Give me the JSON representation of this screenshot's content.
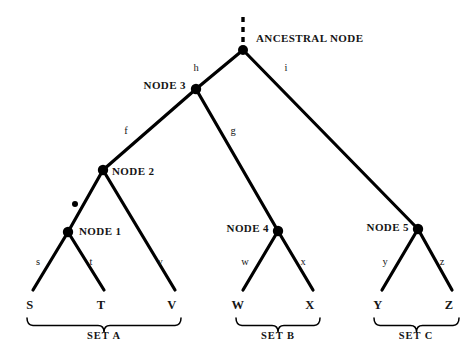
{
  "figure": {
    "type": "phylogenetic-tree-diagram",
    "background_color": "#ffffff",
    "line_color": "#000000",
    "text_color": "#151515"
  },
  "ancestral": {
    "label": "ANCESTRAL NODE",
    "x": 243,
    "y": 50,
    "stem": {
      "x": 243,
      "y_top": 17,
      "y_bottom": 45,
      "style": "dashed"
    }
  },
  "internal_nodes": [
    {
      "id": "node3",
      "label": "NODE 3",
      "x": 196,
      "y": 89,
      "label_x": 136,
      "label_y": 85
    },
    {
      "id": "node2",
      "label": "NODE 2",
      "x": 103,
      "y": 170,
      "label_x": 112,
      "label_y": 171
    },
    {
      "id": "node1",
      "label": "NODE 1",
      "x": 68,
      "y": 232,
      "label_x": 79,
      "label_y": 231
    },
    {
      "id": "node4",
      "label": "NODE 4",
      "x": 278,
      "y": 231,
      "label_x": 219,
      "label_y": 228
    },
    {
      "id": "node5",
      "label": "NODE 5",
      "x": 418,
      "y": 229,
      "label_x": 359,
      "label_y": 227
    }
  ],
  "marker_dot": {
    "x": 75,
    "y": 204,
    "r": 3
  },
  "branches": [
    {
      "id": "h",
      "label": "h",
      "from": "ancestral",
      "to": "node3",
      "x1": 243,
      "y1": 50,
      "x2": 196,
      "y2": 89,
      "label_x": 196,
      "label_y": 68
    },
    {
      "id": "i",
      "label": "i",
      "from": "ancestral",
      "to": "node5",
      "x1": 243,
      "y1": 50,
      "x2": 418,
      "y2": 229,
      "label_x": 286,
      "label_y": 68
    },
    {
      "id": "f",
      "label": "f",
      "from": "node3",
      "to": "node2",
      "x1": 196,
      "y1": 89,
      "x2": 103,
      "y2": 170,
      "label_x": 126,
      "label_y": 131
    },
    {
      "id": "g",
      "label": "g",
      "from": "node3",
      "to": "node4",
      "x1": 196,
      "y1": 89,
      "x2": 278,
      "y2": 231,
      "label_x": 233,
      "label_y": 131
    },
    {
      "id": "u",
      "label": "",
      "from": "node2",
      "to": "node1",
      "x1": 103,
      "y1": 170,
      "x2": 68,
      "y2": 232,
      "label_x": 0,
      "label_y": 0
    },
    {
      "id": "v",
      "label": "v",
      "from": "node2",
      "to": "V",
      "x1": 103,
      "y1": 170,
      "x2": 175,
      "y2": 290,
      "label_x": 160,
      "label_y": 262
    },
    {
      "id": "s",
      "label": "s",
      "from": "node1",
      "to": "S",
      "x1": 68,
      "y1": 232,
      "x2": 33,
      "y2": 290,
      "label_x": 38,
      "label_y": 262
    },
    {
      "id": "t",
      "label": "t",
      "from": "node1",
      "to": "T",
      "x1": 68,
      "y1": 232,
      "x2": 104,
      "y2": 290,
      "label_x": 91,
      "label_y": 262
    },
    {
      "id": "w",
      "label": "w",
      "from": "node4",
      "to": "W",
      "x1": 278,
      "y1": 231,
      "x2": 243,
      "y2": 290,
      "label_x": 245,
      "label_y": 262
    },
    {
      "id": "x",
      "label": "x",
      "from": "node4",
      "to": "X",
      "x1": 278,
      "y1": 231,
      "x2": 313,
      "y2": 290,
      "label_x": 303,
      "label_y": 262
    },
    {
      "id": "y",
      "label": "y",
      "from": "node5",
      "to": "Y",
      "x1": 418,
      "y1": 229,
      "x2": 382,
      "y2": 290,
      "label_x": 385,
      "label_y": 262
    },
    {
      "id": "z",
      "label": "z",
      "from": "node5",
      "to": "Z",
      "x1": 418,
      "y1": 229,
      "x2": 452,
      "y2": 290,
      "label_x": 442,
      "label_y": 262
    }
  ],
  "leaves": [
    {
      "id": "S",
      "label": "S",
      "x": 30,
      "y": 305
    },
    {
      "id": "T",
      "label": "T",
      "x": 101,
      "y": 305
    },
    {
      "id": "V",
      "label": "V",
      "x": 172,
      "y": 305
    },
    {
      "id": "W",
      "label": "W",
      "x": 238,
      "y": 305
    },
    {
      "id": "X",
      "label": "X",
      "x": 310,
      "y": 305
    },
    {
      "id": "Y",
      "label": "Y",
      "x": 378,
      "y": 305
    },
    {
      "id": "Z",
      "label": "Z",
      "x": 449,
      "y": 305
    }
  ],
  "sets": [
    {
      "id": "setA",
      "label": "SET A",
      "x_left": 27,
      "x_right": 181,
      "y": 318,
      "label_x": 104,
      "label_y": 336
    },
    {
      "id": "setB",
      "label": "SET B",
      "x_left": 236,
      "x_right": 320,
      "y": 318,
      "label_x": 278,
      "label_y": 336
    },
    {
      "id": "setC",
      "label": "SET C",
      "x_left": 374,
      "x_right": 459,
      "y": 318,
      "label_x": 416,
      "label_y": 336
    }
  ]
}
